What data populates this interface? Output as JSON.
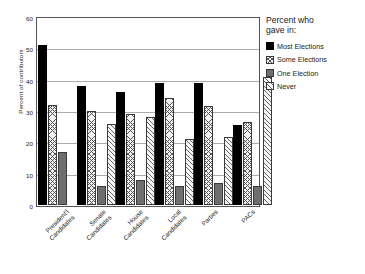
{
  "chart_data": {
    "type": "bar",
    "title": "",
    "xlabel": "",
    "ylabel": "Percent of contributors",
    "ylim": [
      0,
      60
    ],
    "yticks": [
      0,
      10,
      20,
      30,
      40,
      50,
      60
    ],
    "grid": true,
    "legend_position": "right",
    "legend_title": "Percent who gave in:",
    "categories": [
      "President'l Candidates",
      "Senate Candidates",
      "House Candidates",
      "Local Candidates",
      "Parties",
      "PACs"
    ],
    "series": [
      {
        "name": "Most Elections",
        "color": "#000000",
        "pattern": "solid",
        "values": [
          51,
          38,
          36,
          39,
          39,
          25.5
        ]
      },
      {
        "name": "Some Elections",
        "color": "#f2f2f2",
        "pattern": "crosshatch",
        "values": [
          31.8,
          30,
          29,
          34,
          31.5,
          26.5
        ]
      },
      {
        "name": "One Election",
        "color": "#6e6e6e",
        "pattern": "solid-gray",
        "values": [
          17,
          6,
          8,
          6,
          7,
          6
        ]
      },
      {
        "name": "Never",
        "color": "#f7f7f7",
        "pattern": "diagonal",
        "values": [
          0,
          26,
          28,
          21,
          21.8,
          41
        ]
      }
    ]
  },
  "axis": {
    "y_title": "Percent of contributors",
    "y_tick_labels": [
      "0",
      "10",
      "20",
      "30",
      "40",
      "50",
      "60"
    ],
    "x_tick_labels": [
      {
        "line1": "President'l",
        "line2": "Candidates"
      },
      {
        "line1": "Senate",
        "line2": "Candidates"
      },
      {
        "line1": "House",
        "line2": "Candidates"
      },
      {
        "line1": "Local",
        "line2": "Candidates"
      },
      {
        "line1": "Parties",
        "line2": ""
      },
      {
        "line1": "PACs",
        "line2": ""
      }
    ]
  },
  "legend": {
    "title_line1": "Percent who",
    "title_line2": "gave in:",
    "items": [
      {
        "label": "Most Elections"
      },
      {
        "label": "Some Elections"
      },
      {
        "label": "One Election"
      },
      {
        "label": "Never"
      }
    ]
  }
}
